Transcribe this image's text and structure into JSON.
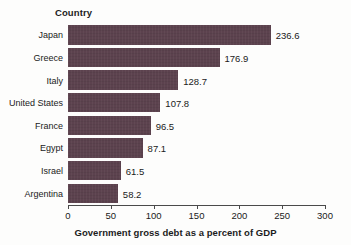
{
  "chart_data": {
    "type": "bar",
    "orientation": "horizontal",
    "title": "",
    "xlabel": "Government gross debt as a percent of GDP",
    "ylabel": "Country",
    "categories": [
      "Japan",
      "Greece",
      "Italy",
      "United States",
      "France",
      "Egypt",
      "Israel",
      "Argentina"
    ],
    "values": [
      236.6,
      176.9,
      128.7,
      107.8,
      96.5,
      87.1,
      61.5,
      58.2
    ],
    "value_labels": [
      "236.6",
      "176.9",
      "128.7",
      "107.8",
      "96.5",
      "87.1",
      "61.5",
      "58.2"
    ],
    "xlim": [
      0,
      300
    ],
    "xticks": [
      0,
      50,
      100,
      150,
      200,
      250,
      300
    ],
    "xtick_labels": [
      "0",
      "50",
      "100",
      "150",
      "200",
      "250",
      "300"
    ],
    "grid": false,
    "legend": null,
    "bar_color": "#5c424e",
    "background_color": "#fdfdfc",
    "axis_color": "#4a4a4a",
    "text_color": "#1a1a1a"
  }
}
